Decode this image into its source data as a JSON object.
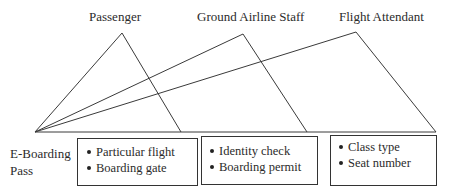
{
  "diagram": {
    "roles": [
      {
        "label": "Passenger",
        "apex": [
          122,
          33
        ],
        "leg_end": [
          181,
          132
        ]
      },
      {
        "label": "Ground Airline Staff",
        "apex": [
          243,
          34
        ],
        "leg_end": [
          307,
          132
        ]
      },
      {
        "label": "Flight Attendant",
        "apex": [
          356,
          32
        ],
        "leg_end": [
          436,
          132
        ]
      }
    ],
    "origin": {
      "label_line1": "E-Boarding",
      "label_line2": "Pass",
      "point": [
        35,
        132
      ]
    },
    "baseline_end": [
      436,
      132
    ],
    "boxes": [
      {
        "items": [
          "Particular flight",
          "Boarding gate"
        ]
      },
      {
        "items": [
          "Identity check",
          "Boarding permit"
        ]
      },
      {
        "items": [
          "Class type",
          "Seat number"
        ]
      }
    ],
    "colors": {
      "line": "#3a3a3a",
      "text": "#2b2b2b",
      "background": "#ffffff"
    }
  }
}
